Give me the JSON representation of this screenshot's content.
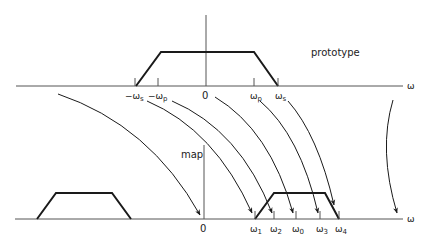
{
  "diagram": {
    "colors": {
      "line": "#1a1a1a",
      "axis": "#555555",
      "background": "#ffffff"
    },
    "top_panel": {
      "title": "prototype",
      "axis_label": "ω",
      "ticks": [
        {
          "label": "−ωs",
          "x": 135
        },
        {
          "label": "−ωp",
          "x": 158
        },
        {
          "label": "0",
          "x": 206
        },
        {
          "label": "ωp",
          "x": 254
        },
        {
          "label": "ωs",
          "x": 278
        }
      ],
      "trapezoid": "lowpass prototype from −ωs to ωs, flat between −ωp and ωp"
    },
    "bottom_panel": {
      "title": "map",
      "axis_label": "ω",
      "ticks": [
        {
          "label": "0",
          "x": 204
        },
        {
          "label": "ω1",
          "x": 255
        },
        {
          "label": "ω2",
          "x": 274
        },
        {
          "label": "ω0",
          "x": 296
        },
        {
          "label": "ω3",
          "x": 320
        },
        {
          "label": "ω4",
          "x": 339
        }
      ],
      "trapezoids": [
        "mirror image band on negative side",
        "bandpass band from ω1 to ω4, flat between ω2 and ω3"
      ]
    },
    "mappings": [
      {
        "from": "−∞",
        "to": "0"
      },
      {
        "from": "−ωs",
        "to": "ω1"
      },
      {
        "from": "−ωp",
        "to": "ω2"
      },
      {
        "from": "0",
        "to": "ω0"
      },
      {
        "from": "ωp",
        "to": "ω3"
      },
      {
        "from": "ωs",
        "to": "ω4"
      },
      {
        "from": "+∞",
        "to": "+∞"
      }
    ]
  },
  "labels": {
    "prototype": "prototype",
    "map": "map",
    "omega": "ω",
    "neg_ws_sign": "−",
    "neg_wp_sign": "−",
    "w": "ω",
    "sub_s": "s",
    "sub_p": "p",
    "zero": "0",
    "sub_1": "1",
    "sub_2": "2",
    "sub_0": "0",
    "sub_3": "3",
    "sub_4": "4"
  }
}
